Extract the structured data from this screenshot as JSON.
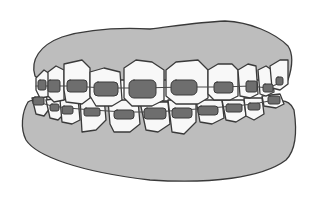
{
  "image": {
    "description": "Line illustration of a set of teeth with dental braces (upper and lower arches, gray gums, dark gray brackets joined by archwires)",
    "colors": {
      "background": "#ffffff",
      "gum": "#bdbdbd",
      "outline": "#3a3a3a",
      "tooth": "#f8f8f8",
      "bracket": "#6e6e6e",
      "wire": "#4a4a4a"
    }
  }
}
